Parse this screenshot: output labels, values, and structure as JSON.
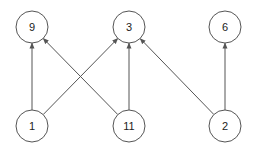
{
  "diagram": {
    "type": "directed-graph",
    "colors": {
      "stroke": "#555555",
      "node_fill": "#ffffff",
      "label": "#222222",
      "background": "#ffffff"
    },
    "node_radius": 16,
    "nodes": [
      {
        "id": "9",
        "label": "9",
        "x": 32,
        "y": 27
      },
      {
        "id": "3",
        "label": "3",
        "x": 129,
        "y": 27
      },
      {
        "id": "6",
        "label": "6",
        "x": 225,
        "y": 27
      },
      {
        "id": "1",
        "label": "1",
        "x": 32,
        "y": 126
      },
      {
        "id": "11",
        "label": "11",
        "x": 129,
        "y": 126
      },
      {
        "id": "2",
        "label": "2",
        "x": 225,
        "y": 126
      }
    ],
    "edges": [
      {
        "from": "1",
        "to": "9"
      },
      {
        "from": "1",
        "to": "3"
      },
      {
        "from": "11",
        "to": "9"
      },
      {
        "from": "11",
        "to": "3"
      },
      {
        "from": "2",
        "to": "3"
      },
      {
        "from": "2",
        "to": "6"
      }
    ]
  }
}
